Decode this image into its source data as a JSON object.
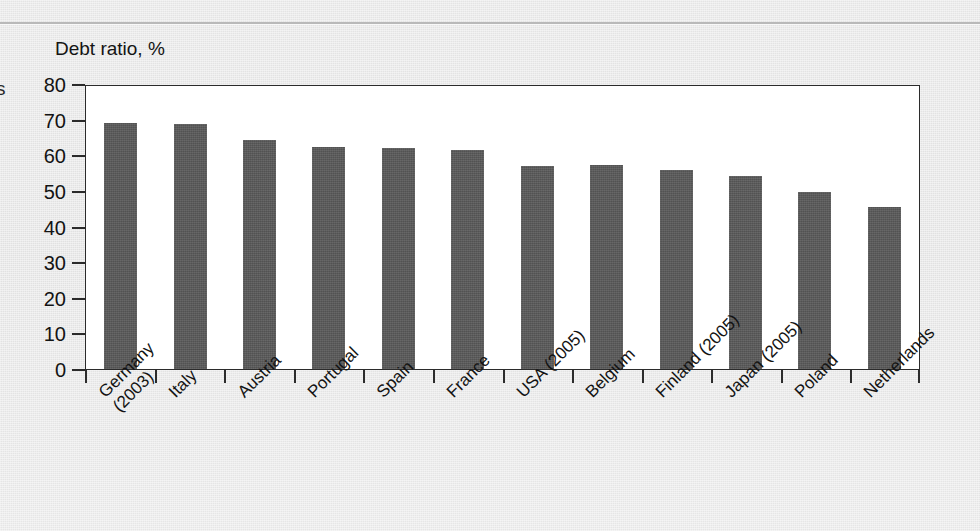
{
  "page": {
    "margin_glyph": "s",
    "background_color": "#e9e9e9"
  },
  "chart_data": {
    "type": "bar",
    "title": "Debt ratio, %",
    "xlabel": "",
    "ylabel": "Debt ratio, %",
    "ylim": [
      0,
      80
    ],
    "yticks": [
      80,
      70,
      60,
      50,
      40,
      30,
      20,
      10,
      0
    ],
    "ytick_labels": [
      "80",
      "70",
      "60",
      "50",
      "40",
      "30",
      "20",
      "10",
      "0"
    ],
    "grid": false,
    "legend": null,
    "bar_color": "#595959",
    "plot_background": "#ffffff",
    "categories": [
      "Germany (2003)",
      "Italy",
      "Austria",
      "Portugal",
      "Spain",
      "France",
      "USA (2005)",
      "Belgium",
      "Finland (2005)",
      "Japan (2005)",
      "Poland",
      "Netherlands"
    ],
    "category_lines": [
      [
        "Germany",
        "(2003)"
      ],
      [
        "Italy",
        ""
      ],
      [
        "Austria",
        ""
      ],
      [
        "Portugal",
        ""
      ],
      [
        "Spain",
        ""
      ],
      [
        "France",
        ""
      ],
      [
        "USA (2005)",
        ""
      ],
      [
        "Belgium",
        ""
      ],
      [
        "Finland (2005)",
        ""
      ],
      [
        "Japan (2005)",
        ""
      ],
      [
        "Poland",
        ""
      ],
      [
        "Netherlands",
        ""
      ]
    ],
    "values": [
      69.1,
      68.7,
      64.2,
      62.3,
      62.1,
      61.5,
      57.1,
      57.2,
      55.9,
      54.2,
      49.6,
      45.6
    ]
  }
}
